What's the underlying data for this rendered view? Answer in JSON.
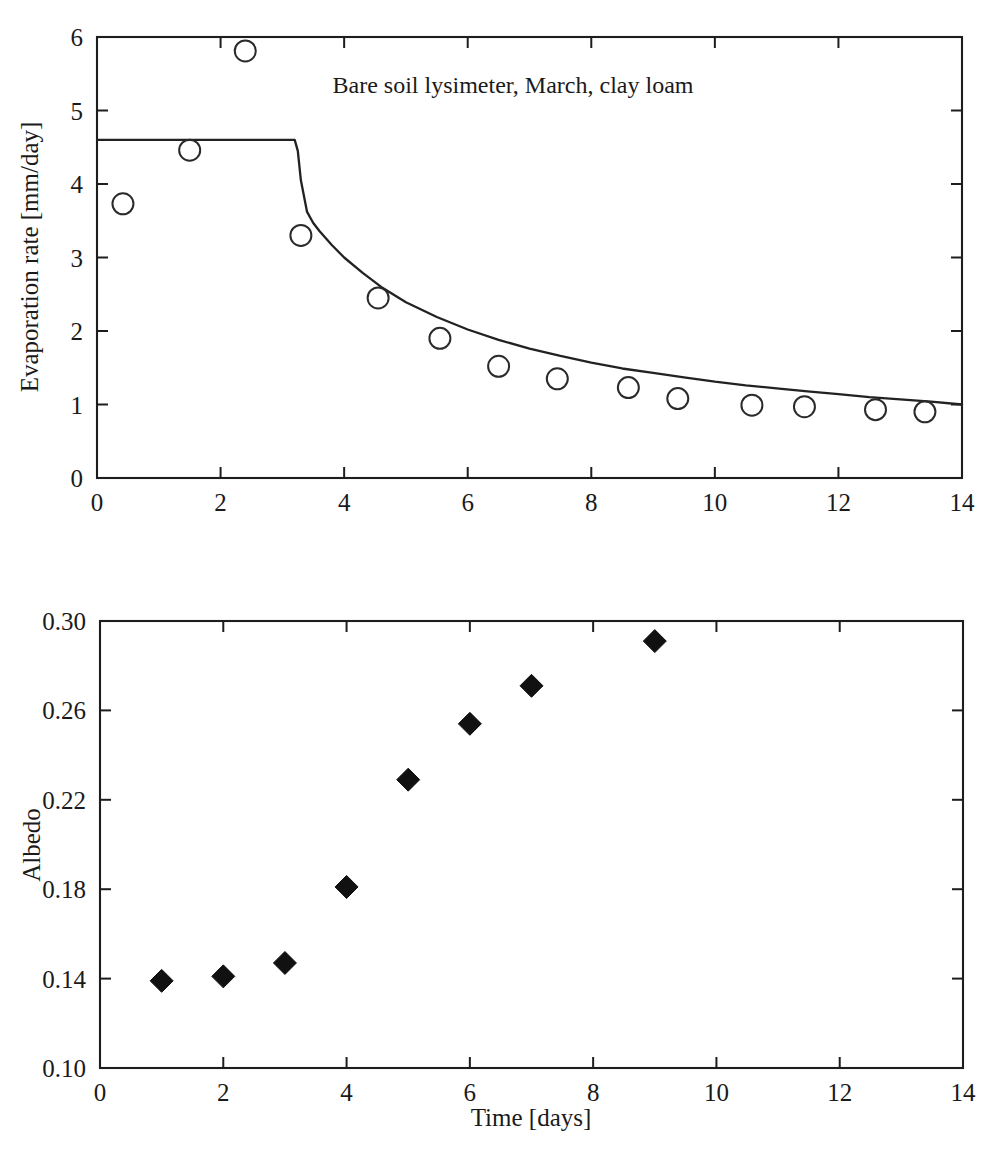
{
  "figure": {
    "background": "#ffffff",
    "ink_color": "#1a1a1a"
  },
  "chart_data": [
    {
      "id": "evaporation-panel",
      "type": "scatter",
      "title": "Bare soil lysimeter, March, clay loam",
      "xlabel": "",
      "ylabel": "Evaporation rate [mm/day]",
      "xlim": [
        0,
        14
      ],
      "ylim": [
        0,
        6
      ],
      "xticks": [
        0,
        2,
        4,
        6,
        8,
        10,
        12,
        14
      ],
      "xticklabels": [
        "0",
        "2",
        "4",
        "6",
        "8",
        "10",
        "12",
        "14"
      ],
      "yticks": [
        0,
        1,
        2,
        3,
        4,
        5,
        6
      ],
      "yticklabels": [
        "0",
        "1",
        "2",
        "3",
        "4",
        "5",
        "6"
      ],
      "grid": false,
      "legend": "none",
      "series": [
        {
          "name": "Measured evaporation",
          "marker": "open-circle",
          "x": [
            0.42,
            1.5,
            2.4,
            3.3,
            4.55,
            5.55,
            6.5,
            7.45,
            8.6,
            9.4,
            10.6,
            11.45,
            12.6,
            13.4
          ],
          "y": [
            3.73,
            4.46,
            5.81,
            3.3,
            2.45,
            1.9,
            1.52,
            1.35,
            1.23,
            1.08,
            0.99,
            0.97,
            0.93,
            0.9
          ]
        },
        {
          "name": "Model curve",
          "marker": "line",
          "x": [
            0.0,
            0.5,
            1.0,
            1.5,
            2.0,
            2.5,
            3.0,
            3.2,
            3.25,
            3.3,
            3.4,
            3.5,
            3.6,
            3.8,
            4.0,
            4.3,
            4.6,
            5.0,
            5.5,
            6.0,
            6.5,
            7.0,
            7.5,
            8.0,
            8.5,
            9.0,
            9.5,
            10.0,
            10.5,
            11.0,
            11.5,
            12.0,
            12.5,
            13.0,
            13.5,
            14.0
          ],
          "y": [
            4.6,
            4.6,
            4.6,
            4.6,
            4.6,
            4.6,
            4.6,
            4.6,
            4.45,
            4.05,
            3.62,
            3.47,
            3.36,
            3.17,
            3.0,
            2.79,
            2.6,
            2.39,
            2.19,
            2.02,
            1.88,
            1.76,
            1.66,
            1.57,
            1.49,
            1.43,
            1.37,
            1.31,
            1.26,
            1.22,
            1.18,
            1.14,
            1.1,
            1.07,
            1.04,
            1.0
          ]
        }
      ]
    },
    {
      "id": "albedo-panel",
      "type": "scatter",
      "title": "",
      "xlabel": "Time [days]",
      "ylabel": "Albedo",
      "xlim": [
        0,
        14
      ],
      "ylim": [
        0.1,
        0.3
      ],
      "xticks": [
        0,
        2,
        4,
        6,
        8,
        10,
        12,
        14
      ],
      "xticklabels": [
        "0",
        "2",
        "4",
        "6",
        "8",
        "10",
        "12",
        "14"
      ],
      "yticks": [
        0.1,
        0.14,
        0.18,
        0.22,
        0.26,
        0.3
      ],
      "yticklabels": [
        "0.10",
        "0.14",
        "0.18",
        "0.22",
        "0.26",
        "0.30"
      ],
      "grid": false,
      "legend": "none",
      "series": [
        {
          "name": "Measured albedo",
          "marker": "filled-diamond",
          "x": [
            1.0,
            2.0,
            3.0,
            4.0,
            5.0,
            6.0,
            7.0,
            9.0
          ],
          "y": [
            0.139,
            0.141,
            0.147,
            0.181,
            0.229,
            0.254,
            0.271,
            0.291
          ]
        }
      ]
    }
  ]
}
